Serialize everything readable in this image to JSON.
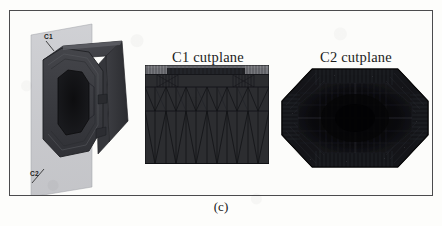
{
  "figure": {
    "caption": "(c)",
    "frame_border_color": "#4b4b4d",
    "background_color": "#fcfcfa"
  },
  "panels": [
    {
      "id": "model",
      "name": "3d-model-with-cutplanes",
      "description": "Isometric view of hollow octagonal-profile solid body intersected by a translucent vertical cutplane",
      "body_color": "#3b3c40",
      "body_highlight_color": "#55565c",
      "body_shadow_color": "#232428",
      "cavity_color": "#121214",
      "cutplane_color": "#b9bac0",
      "labels": [
        {
          "text": "C1",
          "position": "upper-left",
          "leader": true
        },
        {
          "text": "C2",
          "position": "lower-left",
          "leader": true
        }
      ]
    },
    {
      "id": "c1",
      "name": "c1-cutplane-mesh",
      "title": "C1 cutplane",
      "mesh_type": "rectangular finite-element mesh with triangular zigzag elements",
      "fill_color": "#2f3034",
      "line_color": "#17181b",
      "columns": 12,
      "rows": 4,
      "band_rows": 3
    },
    {
      "id": "c2",
      "name": "c2-cutplane-mesh",
      "title": "C2 cutplane",
      "mesh_type": "octagonal cross-section dense finite-element mesh",
      "fill_color": "#151619",
      "core_color": "#0a0a0c",
      "line_color": "#2c2d32",
      "rings": 6,
      "radial_divisions": 48
    }
  ]
}
